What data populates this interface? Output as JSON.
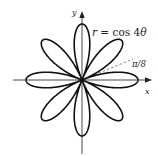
{
  "figure": {
    "type": "polar-rose",
    "equation_label": "r = cos 4θ",
    "equation_parts": {
      "var": "r",
      "eq": " = cos 4",
      "theta": "θ"
    },
    "angle_label": "π/8",
    "x_axis_label": "x",
    "y_axis_label": "y",
    "petals": 8,
    "colors": {
      "curve": "#111111",
      "axis": "#333333",
      "dashed": "#555555",
      "text": "#222222"
    }
  }
}
